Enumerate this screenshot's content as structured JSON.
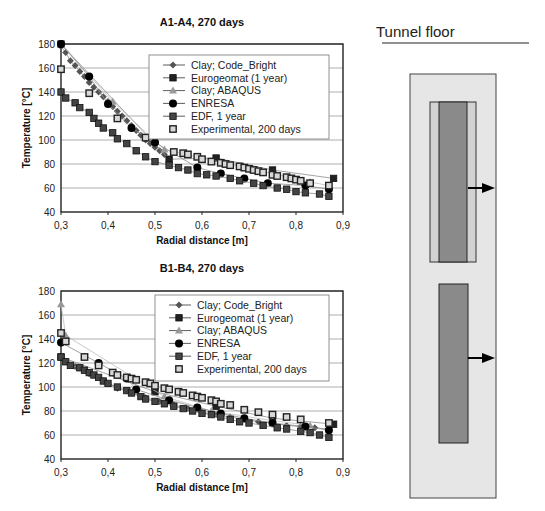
{
  "figure": {
    "tunnel_label": "Tunnel floor"
  },
  "chart_data": [
    {
      "type": "line",
      "title": "A1-A4, 270 days",
      "xlabel": "Radial distance [m]",
      "ylabel": "Temperature [°C]",
      "xlim": [
        0.3,
        0.9
      ],
      "ylim": [
        40,
        180
      ],
      "x_ticks": [
        "0,3",
        "0,4",
        "0,5",
        "0,6",
        "0,7",
        "0,8",
        "0,9"
      ],
      "y_ticks": [
        "40",
        "60",
        "80",
        "100",
        "120",
        "140",
        "160",
        "180"
      ],
      "grid": "horizontal",
      "legend_position": "top-right",
      "series": [
        {
          "name": "Clay;  Code_Bright",
          "marker": "diamond",
          "color": "#555555",
          "x": [
            0.3,
            0.31,
            0.32,
            0.33,
            0.34,
            0.35,
            0.36,
            0.37,
            0.38,
            0.39,
            0.4,
            0.41,
            0.42,
            0.43,
            0.44,
            0.45,
            0.46,
            0.47,
            0.48,
            0.49,
            0.5,
            0.51,
            0.52
          ],
          "y": [
            178,
            173,
            166,
            162,
            157,
            153,
            148,
            144,
            140,
            136,
            132,
            128,
            124,
            120,
            116,
            112,
            108,
            104,
            100,
            97,
            94,
            91,
            88
          ]
        },
        {
          "name": "Eurogeomat  (1 year)",
          "marker": "square",
          "color": "#222222",
          "x": [
            0.3,
            0.53,
            0.63,
            0.75,
            0.88
          ],
          "y": [
            180,
            84,
            85,
            75,
            68
          ]
        },
        {
          "name": "Clay; ABAQUS",
          "marker": "triangle",
          "color": "#999999",
          "x": [
            0.3,
            0.41,
            0.52,
            0.83,
            0.87
          ],
          "y": [
            180,
            132,
            92,
            65,
            62
          ]
        },
        {
          "name": "ENRESA",
          "marker": "circle",
          "color": "#000000",
          "x": [
            0.3,
            0.36,
            0.4,
            0.45,
            0.5,
            0.59,
            0.64,
            0.69,
            0.74,
            0.82,
            0.87
          ],
          "y": [
            180,
            153,
            130,
            110,
            98,
            77,
            72,
            68,
            64,
            62,
            59
          ]
        },
        {
          "name": "EDF, 1 year",
          "marker": "square",
          "color": "#444444",
          "x": [
            0.3,
            0.31,
            0.33,
            0.34,
            0.36,
            0.37,
            0.38,
            0.39,
            0.41,
            0.42,
            0.44,
            0.46,
            0.48,
            0.5,
            0.53,
            0.55,
            0.57,
            0.59,
            0.61,
            0.63,
            0.66,
            0.68,
            0.71,
            0.73,
            0.76,
            0.78,
            0.8,
            0.82,
            0.85,
            0.87
          ],
          "y": [
            140,
            135,
            131,
            127,
            123,
            118,
            114,
            110,
            106,
            101,
            97,
            91,
            86,
            82,
            79,
            77,
            75,
            72,
            71,
            70,
            68,
            66,
            64,
            62,
            60,
            59,
            57,
            56,
            55,
            53
          ]
        },
        {
          "name": "Experimental, 200 days",
          "marker": "open-square",
          "color": "#888888",
          "x": [
            0.3,
            0.36,
            0.42,
            0.48,
            0.54,
            0.56,
            0.57,
            0.59,
            0.6,
            0.62,
            0.64,
            0.65,
            0.66,
            0.68,
            0.69,
            0.7,
            0.71,
            0.72,
            0.73,
            0.75,
            0.76,
            0.78,
            0.79,
            0.8,
            0.81,
            0.83,
            0.87
          ],
          "y": [
            159,
            139,
            118,
            102,
            90,
            89,
            88,
            86,
            84,
            82,
            81,
            80,
            79,
            78,
            77,
            76,
            75,
            74,
            73,
            71,
            70,
            69,
            68,
            67,
            66,
            64,
            62
          ]
        }
      ]
    },
    {
      "type": "line",
      "title": "B1-B4, 270 days",
      "xlabel": "Radial distance [m]",
      "ylabel": "Temperature [°C]",
      "xlim": [
        0.3,
        0.9
      ],
      "ylim": [
        40,
        180
      ],
      "x_ticks": [
        "0,3",
        "0,4",
        "0,5",
        "0,6",
        "0,7",
        "0,8",
        "0,9"
      ],
      "y_ticks": [
        "40",
        "60",
        "80",
        "100",
        "120",
        "140",
        "160",
        "180"
      ],
      "grid": "horizontal",
      "legend_position": "top-right",
      "series": [
        {
          "name": "Clay;  Code_Bright",
          "marker": "diamond",
          "color": "#555555",
          "x": [
            0.3,
            0.33,
            0.36,
            0.39,
            0.42,
            0.45,
            0.48,
            0.51,
            0.54,
            0.57,
            0.6,
            0.63,
            0.66,
            0.69,
            0.72,
            0.75,
            0.78,
            0.81,
            0.84,
            0.87
          ],
          "y": [
            124,
            117,
            111,
            105,
            99,
            95,
            91,
            88,
            85,
            82,
            79,
            77,
            75,
            73,
            71,
            70,
            68,
            67,
            66,
            65
          ]
        },
        {
          "name": "Eurogeomat  (1 year)",
          "marker": "square",
          "color": "#222222",
          "x": [
            0.3,
            0.5,
            0.63,
            0.75,
            0.88
          ],
          "y": [
            125,
            96,
            84,
            74,
            69
          ]
        },
        {
          "name": "Clay; ABAQUS",
          "marker": "triangle",
          "color": "#999999",
          "x": [
            0.3,
            0.31,
            0.52,
            0.62,
            0.75,
            0.83
          ],
          "y": [
            169,
            143,
            92,
            80,
            72,
            68
          ]
        },
        {
          "name": "ENRESA",
          "marker": "circle",
          "color": "#000000",
          "x": [
            0.3,
            0.38,
            0.44,
            0.46,
            0.53,
            0.59,
            0.64,
            0.69,
            0.75,
            0.82,
            0.87
          ],
          "y": [
            137,
            120,
            107,
            98,
            89,
            83,
            78,
            74,
            70,
            67,
            64
          ]
        },
        {
          "name": "EDF, 1 year",
          "marker": "square",
          "color": "#444444",
          "x": [
            0.3,
            0.31,
            0.32,
            0.34,
            0.35,
            0.36,
            0.37,
            0.38,
            0.39,
            0.4,
            0.42,
            0.44,
            0.45,
            0.47,
            0.48,
            0.5,
            0.52,
            0.54,
            0.56,
            0.58,
            0.6,
            0.62,
            0.64,
            0.66,
            0.68,
            0.7,
            0.73,
            0.76,
            0.78,
            0.81,
            0.83,
            0.85,
            0.87
          ],
          "y": [
            125,
            121,
            118,
            116,
            114,
            112,
            110,
            108,
            105,
            103,
            100,
            97,
            95,
            92,
            90,
            88,
            86,
            84,
            82,
            80,
            78,
            77,
            75,
            73,
            71,
            70,
            68,
            66,
            65,
            63,
            62,
            60,
            58
          ]
        },
        {
          "name": "Experimental, 200 days",
          "marker": "open-square",
          "color": "#888888",
          "x": [
            0.3,
            0.31,
            0.35,
            0.38,
            0.41,
            0.42,
            0.44,
            0.45,
            0.46,
            0.48,
            0.49,
            0.5,
            0.52,
            0.53,
            0.55,
            0.56,
            0.58,
            0.59,
            0.6,
            0.62,
            0.63,
            0.64,
            0.66,
            0.69,
            0.72,
            0.75,
            0.78,
            0.81,
            0.87
          ],
          "y": [
            145,
            138,
            125,
            118,
            112,
            110,
            108,
            107,
            106,
            104,
            103,
            101,
            99,
            98,
            96,
            95,
            93,
            92,
            91,
            89,
            88,
            86,
            85,
            81,
            79,
            77,
            75,
            73,
            70
          ]
        }
      ]
    }
  ],
  "diagram": {
    "arrow_count": 2,
    "canisters": 2
  }
}
